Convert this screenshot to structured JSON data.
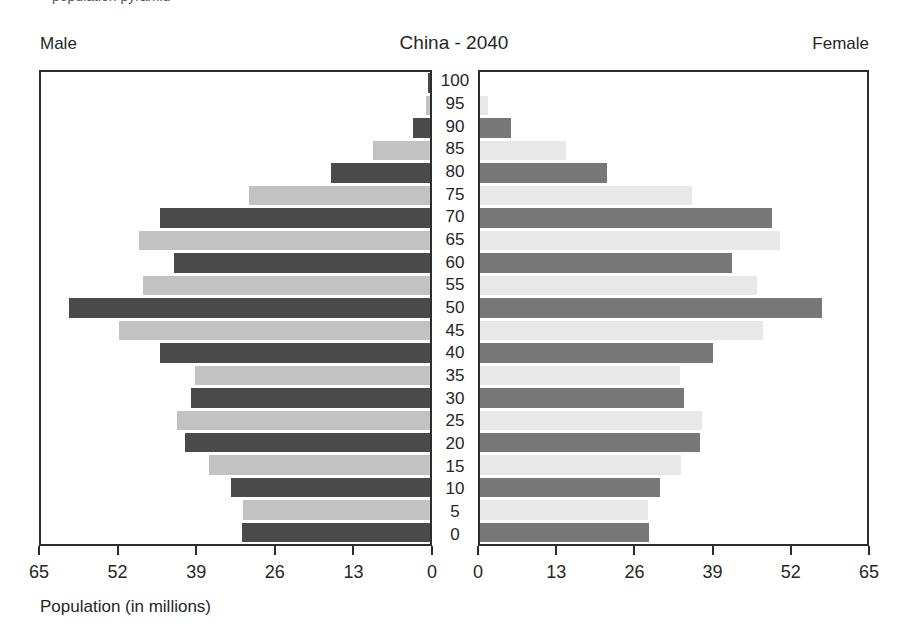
{
  "page": {
    "top_caption_fragment": "population pyramid"
  },
  "header": {
    "left_label": "Male",
    "title": "China - 2040",
    "right_label": "Female"
  },
  "axis": {
    "xlabel": "Population (in millions)",
    "male_tick_labels": [
      "65",
      "52",
      "39",
      "26",
      "13",
      "0"
    ],
    "female_tick_labels": [
      "0",
      "13",
      "26",
      "39",
      "52",
      "65"
    ]
  },
  "chart_data": {
    "type": "bar",
    "subtype": "population_pyramid",
    "title": "China - 2040",
    "xlabel": "Population (in millions)",
    "unit": "millions of people",
    "xlim": [
      0,
      65
    ],
    "x_ticks": [
      0,
      13,
      26,
      39,
      52,
      65
    ],
    "grid": false,
    "legend": "none",
    "age_groups_top_to_bottom": [
      100,
      95,
      90,
      85,
      80,
      75,
      70,
      65,
      60,
      55,
      50,
      45,
      40,
      35,
      30,
      25,
      20,
      15,
      10,
      5,
      0
    ],
    "series": [
      {
        "name": "Male",
        "side": "left",
        "values_top_to_bottom": [
          0.4,
          0.7,
          2.8,
          9.5,
          16.5,
          30.2,
          45.1,
          48.7,
          42.7,
          48.0,
          60.4,
          51.9,
          45.1,
          39.2,
          40.0,
          42.2,
          40.9,
          37.0,
          33.3,
          31.3,
          31.4
        ]
      },
      {
        "name": "Female",
        "side": "right",
        "values_top_to_bottom": [
          0,
          1.3,
          5.2,
          14.5,
          21.3,
          35.6,
          49.0,
          50.4,
          42.3,
          46.6,
          57.5,
          47.5,
          39.1,
          33.6,
          34.2,
          37.3,
          37.0,
          33.7,
          30.2,
          28.2,
          28.4
        ]
      }
    ],
    "colors": {
      "male_decade_bar": "#4a4a4a",
      "male_mid_bar": "#c2c2c2",
      "female_decade_bar": "#777777",
      "female_mid_bar": "#e8e8e8",
      "axis": "#2d2d2d",
      "background": "#ffffff"
    }
  }
}
